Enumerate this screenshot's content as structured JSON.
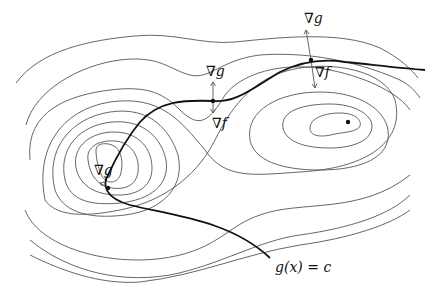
{
  "figure": {
    "labels": {
      "grad_g_symbol": "∇",
      "grad_g_var": "g",
      "grad_f_symbol": "∇",
      "grad_f_var": "f",
      "constraint": "g(x) = c"
    },
    "colors": {
      "contour": "#555555",
      "constraint": "#111111",
      "background": "#ffffff"
    },
    "markers": [
      {
        "name": "left-tangent-point",
        "x": 108,
        "y": 188
      },
      {
        "name": "middle-tangent-point",
        "x": 213,
        "y": 101
      },
      {
        "name": "right-tangent-point",
        "x": 311,
        "y": 60
      },
      {
        "name": "right-extremum",
        "x": 348,
        "y": 122
      }
    ]
  }
}
